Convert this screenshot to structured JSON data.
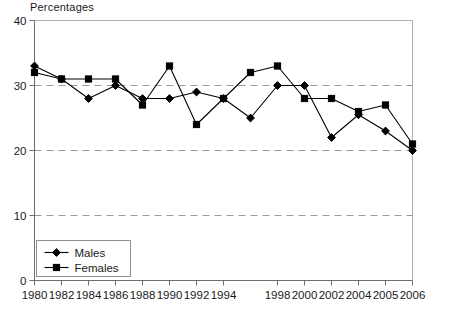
{
  "chart_data": {
    "type": "line",
    "title": "Percentages",
    "xlabel": "",
    "ylabel": "",
    "ylim": [
      0,
      40
    ],
    "yticks": [
      0,
      10,
      20,
      30,
      40
    ],
    "grid": "horizontal-dashed-at-10-20-30",
    "legend_position": "bottom-left-inside",
    "categories": [
      "1980",
      "1982",
      "1984",
      "1986",
      "1988",
      "1990",
      "1992",
      "1994",
      "1996",
      "1998",
      "2000",
      "2002",
      "2004",
      "2005",
      "2006"
    ],
    "tick_labels_shown": [
      "1980",
      "1982",
      "1984",
      "1986",
      "1988",
      "1990",
      "1992",
      "1994",
      "1998",
      "2000",
      "2002",
      "2004",
      "2005",
      "2006"
    ],
    "series": [
      {
        "name": "Males",
        "marker": "diamond",
        "values": [
          33,
          31,
          28,
          30,
          28,
          28,
          29,
          28,
          25,
          30,
          30,
          22,
          25.5,
          23,
          20
        ]
      },
      {
        "name": "Females",
        "marker": "square",
        "values": [
          32,
          31,
          31,
          31,
          27,
          33,
          24,
          28,
          32,
          33,
          28,
          28,
          26,
          27,
          21
        ]
      }
    ],
    "colors": {
      "line": "#000000",
      "marker": "#000000",
      "grid": "#9a9a9a",
      "axis": "#6e6e6e",
      "background": "#ffffff"
    }
  },
  "legend": {
    "items": [
      {
        "label": "Males"
      },
      {
        "label": "Females"
      }
    ]
  },
  "axis": {
    "y_labels": [
      "40",
      "30",
      "20",
      "10",
      "0"
    ],
    "x_labels": [
      "1980",
      "1982",
      "1984",
      "1986",
      "1988",
      "1990",
      "1992",
      "1994",
      "1998",
      "2000",
      "2002",
      "2004",
      "2005",
      "2006"
    ]
  }
}
